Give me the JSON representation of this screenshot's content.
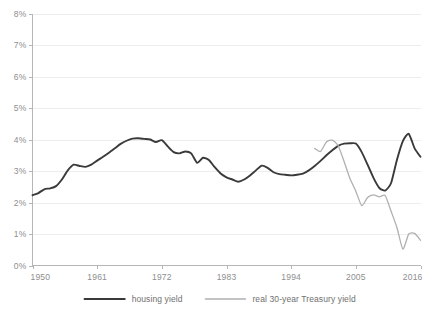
{
  "chart_data": {
    "type": "line",
    "title": "",
    "xlabel": "",
    "ylabel": "",
    "xlim": [
      1950,
      2016
    ],
    "ylim": [
      0,
      8
    ],
    "grid": true,
    "legend_position": "bottom",
    "x_ticks": [
      "1950",
      "1961",
      "1972",
      "1983",
      "1994",
      "2005",
      "2016"
    ],
    "x_tick_values": [
      1950,
      1961,
      1972,
      1983,
      1994,
      2005,
      2016
    ],
    "y_ticks": [
      "0%",
      "1%",
      "2%",
      "3%",
      "4%",
      "5%",
      "6%",
      "7%",
      "8%"
    ],
    "y_tick_values": [
      0,
      1,
      2,
      3,
      4,
      5,
      6,
      7,
      8
    ],
    "series": [
      {
        "name": "housing yield",
        "color": "#3a3a3a",
        "width": 1.9,
        "x": [
          1950,
          1951,
          1952,
          1953,
          1954,
          1955,
          1956,
          1957,
          1958,
          1959,
          1960,
          1961,
          1962,
          1963,
          1964,
          1965,
          1966,
          1967,
          1968,
          1969,
          1970,
          1971,
          1972,
          1973,
          1974,
          1975,
          1976,
          1977,
          1978,
          1979,
          1980,
          1981,
          1982,
          1983,
          1984,
          1985,
          1986,
          1987,
          1988,
          1989,
          1990,
          1991,
          1992,
          1993,
          1994,
          1995,
          1996,
          1997,
          1998,
          1999,
          2000,
          2001,
          2002,
          2003,
          2004,
          2005,
          2006,
          2007,
          2008,
          2009,
          2010,
          2011,
          2012,
          2013,
          2014,
          2015,
          2016
        ],
        "values": [
          2.23,
          2.3,
          2.42,
          2.45,
          2.52,
          2.73,
          3.02,
          3.2,
          3.16,
          3.13,
          3.2,
          3.33,
          3.45,
          3.58,
          3.72,
          3.86,
          3.96,
          4.03,
          4.04,
          4.02,
          4.0,
          3.92,
          3.98,
          3.78,
          3.6,
          3.56,
          3.62,
          3.56,
          3.26,
          3.42,
          3.35,
          3.12,
          2.92,
          2.8,
          2.73,
          2.66,
          2.73,
          2.86,
          3.02,
          3.17,
          3.1,
          2.96,
          2.9,
          2.88,
          2.86,
          2.88,
          2.92,
          3.02,
          3.16,
          3.32,
          3.5,
          3.66,
          3.8,
          3.87,
          3.88,
          3.87,
          3.6,
          3.2,
          2.78,
          2.46,
          2.38,
          2.62,
          3.36,
          3.95,
          4.18,
          3.72,
          3.45
        ]
      },
      {
        "name": "real 30-year Treasury yield",
        "color": "#b0b0b0",
        "width": 1.3,
        "x": [
          1998,
          1999,
          2000,
          2001,
          2002,
          2003,
          2004,
          2005,
          2006,
          2007,
          2008,
          2009,
          2010,
          2011,
          2012,
          2013,
          2014,
          2015,
          2016
        ],
        "values": [
          3.72,
          3.62,
          3.92,
          3.98,
          3.8,
          3.3,
          2.76,
          2.36,
          1.9,
          2.16,
          2.24,
          2.18,
          2.22,
          1.72,
          1.2,
          0.52,
          1.0,
          1.02,
          0.8
        ]
      }
    ]
  },
  "legend": {
    "items": [
      {
        "label": "housing yield",
        "color": "#3a3a3a"
      },
      {
        "label": "real 30-year Treasury yield",
        "color": "#b0b0b0"
      }
    ]
  }
}
